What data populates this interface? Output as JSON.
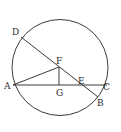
{
  "diagram": {
    "type": "geometry",
    "circle": {
      "cx": 60,
      "cy": 67.5,
      "r": 48
    },
    "points": {
      "A": {
        "x": 13,
        "y": 85,
        "label": "A",
        "lx": 5,
        "ly": 89
      },
      "B": {
        "x": 98,
        "y": 97,
        "label": "B",
        "lx": 97,
        "ly": 106
      },
      "C": {
        "x": 107,
        "y": 85,
        "label": "C",
        "lx": 103,
        "ly": 90
      },
      "D": {
        "x": 21,
        "y": 37,
        "label": "D",
        "lx": 12,
        "ly": 35
      },
      "E": {
        "x": 82,
        "y": 85,
        "label": "E",
        "lx": 78,
        "ly": 84
      },
      "F": {
        "x": 59,
        "y": 67,
        "label": "F",
        "lx": 56,
        "ly": 64
      },
      "G": {
        "x": 59,
        "y": 85,
        "label": "G",
        "lx": 56,
        "ly": 96
      }
    },
    "segments": [
      [
        "D",
        "B"
      ],
      [
        "A",
        "C"
      ],
      [
        "A",
        "F"
      ],
      [
        "F",
        "G"
      ]
    ],
    "colors": {
      "line": "#3a3a3a",
      "background": "#ffffff"
    }
  }
}
